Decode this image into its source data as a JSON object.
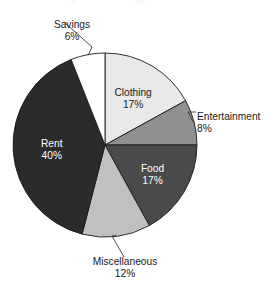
{
  "chart_data": {
    "type": "pie",
    "title": "",
    "subtitle": "",
    "xlabel": "",
    "ylabel": "",
    "legend_position": "none",
    "grid": false,
    "unit": "%",
    "start_angle_deg": 0,
    "direction": "clockwise",
    "total": 100,
    "categories": [
      "Clothing",
      "Entertainment",
      "Food",
      "Miscellaneous",
      "Rent",
      "Savings"
    ],
    "values": [
      17,
      8,
      17,
      12,
      40,
      6
    ],
    "slices": [
      {
        "name": "Clothing",
        "label": "Clothing",
        "value": 17,
        "value_label": "17%",
        "color": "#e9e9e9",
        "label_placement": "inside",
        "text_color": "dark"
      },
      {
        "name": "Entertainment",
        "label": "Entertainment",
        "value": 8,
        "value_label": "8%",
        "color": "#909090",
        "label_placement": "outside",
        "text_color": "dark"
      },
      {
        "name": "Food",
        "label": "Food",
        "value": 17,
        "value_label": "17%",
        "color": "#4a4a4a",
        "label_placement": "inside",
        "text_color": "light"
      },
      {
        "name": "Miscellaneous",
        "label": "Miscellaneous",
        "value": 12,
        "value_label": "12%",
        "color": "#c0c0c0",
        "label_placement": "outside",
        "text_color": "dark"
      },
      {
        "name": "Rent",
        "label": "Rent",
        "value": 40,
        "value_label": "40%",
        "color": "#2b2b2b",
        "label_placement": "inside",
        "text_color": "light"
      },
      {
        "name": "Savings",
        "label": "Savings",
        "value": 6,
        "value_label": "6%",
        "color": "#ffffff",
        "label_placement": "outside",
        "text_color": "dark"
      }
    ],
    "geometry": {
      "center_x": 105,
      "center_y": 145,
      "radius": 92
    },
    "style": {
      "outline_color": "#1a1a1a",
      "leader_color": "#3a3a3a",
      "background": "#ffffff"
    }
  }
}
